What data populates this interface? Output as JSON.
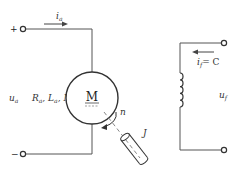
{
  "diagram": {
    "type": "circuit",
    "armature_circuit": {
      "plus_terminal": "+",
      "minus_terminal": "−",
      "current_label": "i",
      "current_sub": "a",
      "voltage_label": "u",
      "voltage_sub": "a",
      "parameters": [
        {
          "sym": "R",
          "sub": "a"
        },
        {
          "sym": "L",
          "sub": "a"
        },
        {
          "sym": "M",
          "sub": ""
        }
      ],
      "motor_label": "M"
    },
    "mechanical": {
      "speed_label": "n",
      "inertia_label": "J"
    },
    "field_circuit": {
      "current_label": "i",
      "current_sub": "f",
      "current_value": "= C",
      "voltage_label": "u",
      "voltage_sub": "f"
    },
    "colors": {
      "line": "#555555",
      "text": "#333333",
      "background": "#ffffff"
    }
  }
}
